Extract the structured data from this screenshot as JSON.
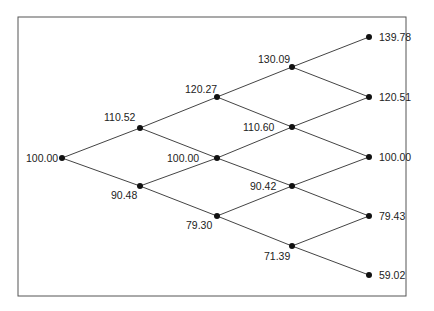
{
  "diagram": {
    "type": "binomial-tree",
    "frame": {
      "x": 18,
      "y": 17,
      "width": 388,
      "height": 279,
      "stroke": "#555555"
    },
    "line_color": "#444444",
    "node_color": "#111111",
    "nodes": [
      {
        "id": "n0_0",
        "x": 62,
        "y": 158,
        "label": "100.00",
        "lx": 26,
        "ly": 162,
        "anchor": "start"
      },
      {
        "id": "n1_0",
        "x": 140,
        "y": 128,
        "label": "110.52",
        "lx": 104,
        "ly": 121,
        "anchor": "start"
      },
      {
        "id": "n1_1",
        "x": 140,
        "y": 186,
        "label": "90.48",
        "lx": 111,
        "ly": 199,
        "anchor": "start"
      },
      {
        "id": "n2_0",
        "x": 217,
        "y": 97,
        "label": "120.27",
        "lx": 185,
        "ly": 93,
        "anchor": "start"
      },
      {
        "id": "n2_1",
        "x": 217,
        "y": 158,
        "label": "100.00",
        "lx": 167,
        "ly": 162,
        "anchor": "start"
      },
      {
        "id": "n2_2",
        "x": 217,
        "y": 216,
        "label": "79.30",
        "lx": 186,
        "ly": 229,
        "anchor": "start"
      },
      {
        "id": "n3_0",
        "x": 292,
        "y": 67,
        "label": "130.09",
        "lx": 258,
        "ly": 63,
        "anchor": "start"
      },
      {
        "id": "n3_1",
        "x": 292,
        "y": 127,
        "label": "110.60",
        "lx": 243,
        "ly": 131,
        "anchor": "start"
      },
      {
        "id": "n3_2",
        "x": 292,
        "y": 186,
        "label": "90.42",
        "lx": 250,
        "ly": 190,
        "anchor": "start"
      },
      {
        "id": "n3_3",
        "x": 292,
        "y": 246,
        "label": "71.39",
        "lx": 264,
        "ly": 260,
        "anchor": "start"
      },
      {
        "id": "n4_0",
        "x": 369,
        "y": 37,
        "label": "139.78",
        "lx": 379,
        "ly": 41,
        "anchor": "start"
      },
      {
        "id": "n4_1",
        "x": 369,
        "y": 97,
        "label": "120.51",
        "lx": 379,
        "ly": 101,
        "anchor": "start"
      },
      {
        "id": "n4_2",
        "x": 369,
        "y": 157,
        "label": "100.00",
        "lx": 379,
        "ly": 161,
        "anchor": "start"
      },
      {
        "id": "n4_3",
        "x": 369,
        "y": 216,
        "label": "79.43",
        "lx": 379,
        "ly": 220,
        "anchor": "start"
      },
      {
        "id": "n4_4",
        "x": 369,
        "y": 275,
        "label": "59.02",
        "lx": 379,
        "ly": 279,
        "anchor": "start"
      }
    ],
    "edges": [
      [
        "n0_0",
        "n1_0"
      ],
      [
        "n0_0",
        "n1_1"
      ],
      [
        "n1_0",
        "n2_0"
      ],
      [
        "n1_0",
        "n2_1"
      ],
      [
        "n1_1",
        "n2_1"
      ],
      [
        "n1_1",
        "n2_2"
      ],
      [
        "n2_0",
        "n3_0"
      ],
      [
        "n2_0",
        "n3_1"
      ],
      [
        "n2_1",
        "n3_1"
      ],
      [
        "n2_1",
        "n3_2"
      ],
      [
        "n2_2",
        "n3_2"
      ],
      [
        "n2_2",
        "n3_3"
      ],
      [
        "n3_0",
        "n4_0"
      ],
      [
        "n3_0",
        "n4_1"
      ],
      [
        "n3_1",
        "n4_1"
      ],
      [
        "n3_1",
        "n4_2"
      ],
      [
        "n3_2",
        "n4_2"
      ],
      [
        "n3_2",
        "n4_3"
      ],
      [
        "n3_3",
        "n4_3"
      ],
      [
        "n3_3",
        "n4_4"
      ]
    ]
  }
}
